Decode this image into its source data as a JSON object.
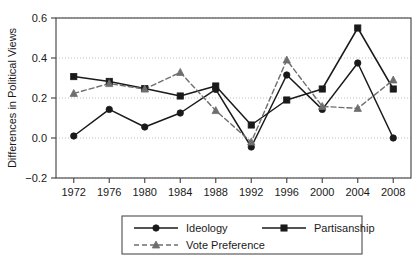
{
  "chart_data": {
    "type": "line",
    "title": "",
    "xlabel": "",
    "ylabel": "Differences in Political Views",
    "categories": [
      "1972",
      "1976",
      "1980",
      "1984",
      "1988",
      "1992",
      "1996",
      "2000",
      "2004",
      "2008"
    ],
    "x": [
      1972,
      1976,
      1980,
      1984,
      1988,
      1992,
      1996,
      2000,
      2004,
      2008
    ],
    "xlim": [
      1970,
      2010
    ],
    "ylim": [
      -0.2,
      0.6
    ],
    "yticks": [
      -0.2,
      0.0,
      0.2,
      0.4,
      0.6
    ],
    "ytick_labels": [
      "−0.2",
      "0.0",
      "0.2",
      "0.4",
      "0.6"
    ],
    "grid": true,
    "grid_axis": "y",
    "legend_position": "bottom",
    "series": [
      {
        "name": "Ideology",
        "marker": "circle",
        "linestyle": "solid",
        "color": "#1a1a1a",
        "values": [
          0.01,
          0.143,
          0.055,
          0.125,
          0.243,
          -0.045,
          0.315,
          0.143,
          0.375,
          0.0
        ]
      },
      {
        "name": "Partisanship",
        "marker": "square",
        "linestyle": "solid",
        "color": "#1a1a1a",
        "values": [
          0.307,
          0.283,
          0.247,
          0.21,
          0.26,
          0.065,
          0.19,
          0.245,
          0.55,
          0.245
        ]
      },
      {
        "name": "Vote Preference",
        "marker": "triangle",
        "linestyle": "dashed",
        "color": "#6e6e6e",
        "values": [
          0.223,
          0.272,
          0.245,
          0.328,
          0.137,
          -0.02,
          0.39,
          0.158,
          0.148,
          0.29
        ]
      }
    ]
  },
  "legend": {
    "entries": [
      {
        "label": "Ideology"
      },
      {
        "label": "Partisanship"
      },
      {
        "label": "Vote Preference"
      }
    ]
  }
}
